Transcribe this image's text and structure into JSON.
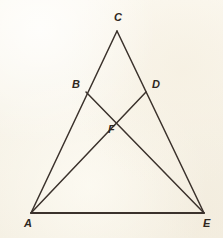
{
  "figure": {
    "kind": "geometry-diagram",
    "background_color": "#faf6ec",
    "line_color": "#3b322c",
    "label_color": "#2f2721",
    "width": 223,
    "height": 238,
    "points": [
      {
        "id": "C",
        "label": "C",
        "x": 117,
        "y": 31,
        "label_x": 114,
        "label_y": 12
      },
      {
        "id": "B",
        "label": "B",
        "x": 86,
        "y": 92,
        "label_x": 72,
        "label_y": 79
      },
      {
        "id": "D",
        "label": "D",
        "x": 146,
        "y": 92,
        "label_x": 152,
        "label_y": 79
      },
      {
        "id": "F",
        "label": "F",
        "x": 116,
        "y": 121,
        "label_x": 108,
        "label_y": 124
      },
      {
        "id": "A",
        "label": "A",
        "x": 31,
        "y": 213,
        "label_x": 24,
        "label_y": 218
      },
      {
        "id": "E",
        "label": "E",
        "x": 204,
        "y": 213,
        "label_x": 203,
        "label_y": 218
      }
    ],
    "segments": [
      {
        "id": "AC",
        "name": "side-ac",
        "from": "A",
        "to": "C"
      },
      {
        "id": "CE",
        "name": "side-ce",
        "from": "C",
        "to": "E"
      },
      {
        "id": "AE",
        "name": "side-ae",
        "from": "A",
        "to": "E"
      },
      {
        "id": "BE",
        "name": "cevian-be",
        "from": "B",
        "to": "E"
      },
      {
        "id": "AD",
        "name": "cevian-ad",
        "from": "A",
        "to": "D"
      }
    ]
  }
}
